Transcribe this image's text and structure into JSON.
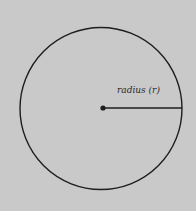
{
  "diagram": {
    "type": "circle-radius",
    "label": "radius (r)",
    "colors": {
      "background": "#c9c9c9",
      "stroke": "#1e1e1e"
    }
  }
}
